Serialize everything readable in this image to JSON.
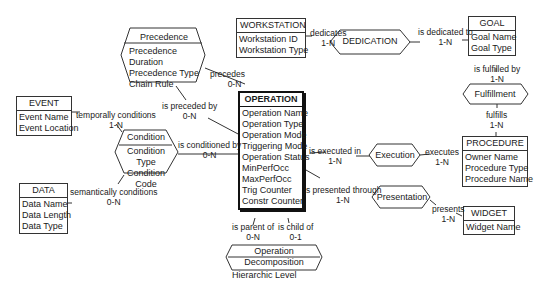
{
  "entities": {
    "workstation": {
      "title": "WORKSTATION",
      "attributes": [
        "Workstation ID",
        "Workstation Type"
      ]
    },
    "goal": {
      "title": "GOAL",
      "attributes": [
        "Goal Name",
        "Goal Type"
      ]
    },
    "event": {
      "title": "EVENT",
      "attributes": [
        "Event Name",
        "Event Location"
      ]
    },
    "operation": {
      "title": "OPERATION",
      "attributes": [
        "Operation Name",
        "Operation Type",
        "Operation Mode",
        "Triggering Mode",
        "Operation Status",
        "MinPerfOcc",
        "MaxPerfOcc",
        "Trig Counter",
        "Constr Counter"
      ]
    },
    "procedure": {
      "title": "PROCEDURE",
      "attributes": [
        "Owner Name",
        "Procedure Type",
        "Procedure Name"
      ]
    },
    "data": {
      "title": "DATA",
      "attributes": [
        "Data Name",
        "Data Length",
        "Data Type"
      ]
    },
    "widget": {
      "title": "WIDGET",
      "attributes": [
        "Widget Name"
      ]
    }
  },
  "relationships": {
    "precedence": {
      "title": "Precedence",
      "attributes": [
        "Precedence Duration",
        "Precedence Type",
        "Chain Rule"
      ]
    },
    "dedication": {
      "title": "DEDICATION",
      "attributes": []
    },
    "fulfillment": {
      "title": "Fulfillment",
      "attributes": []
    },
    "condition": {
      "title": "Condition",
      "attributes": [
        "Condition Type",
        "Condition Code"
      ]
    },
    "execution": {
      "title": "Execution",
      "attributes": []
    },
    "presentation": {
      "title": "Presentation",
      "attributes": []
    },
    "decomposition": {
      "title": "Operation Decomposition",
      "attributes": [
        "Hierarchic Level"
      ]
    }
  },
  "roles": {
    "dedicates": {
      "role": "dedicates",
      "card": "1-N"
    },
    "is_dedicated_to": {
      "role": "is dedicated to",
      "card": "1-N"
    },
    "is_fulfilled_by": {
      "role": "is fulfilled by",
      "card": "1-N"
    },
    "fulfills": {
      "role": "fulfills",
      "card": "1-N"
    },
    "precedes": {
      "role": "precedes",
      "card": "0-N"
    },
    "is_preceded_by": {
      "role": "is preceded by",
      "card": "0-N"
    },
    "temporally_conditions": {
      "role": "temporally conditions",
      "card": "1-N"
    },
    "is_conditioned_by": {
      "role": "is conditioned by",
      "card": "0-N"
    },
    "semantically_conditions": {
      "role": "semantically conditions",
      "card": "0-N"
    },
    "is_executed_in": {
      "role": "is executed in",
      "card": "1-N"
    },
    "executes": {
      "role": "executes",
      "card": "1-N"
    },
    "is_presented_through": {
      "role": "is presented through",
      "card": "1-N"
    },
    "presents": {
      "role": "presents",
      "card": "1-N"
    },
    "is_parent_of": {
      "role": "is parent of",
      "card": "0-N"
    },
    "is_child_of": {
      "role": "is child of",
      "card": "0-1"
    }
  }
}
